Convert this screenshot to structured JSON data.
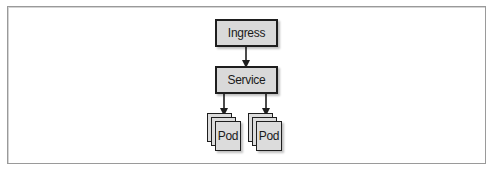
{
  "diagram": {
    "nodes": {
      "ingress": {
        "label": "Ingress"
      },
      "service": {
        "label": "Service"
      },
      "pod_group_left": {
        "label": "Pod"
      },
      "pod_group_right": {
        "label": "Pod"
      }
    },
    "edges": [
      {
        "from": "Ingress",
        "to": "Service"
      },
      {
        "from": "Service",
        "to": "Pod (left group)"
      },
      {
        "from": "Service",
        "to": "Pod (right group)"
      }
    ],
    "colors": {
      "node_fill": "#d9d9d9",
      "node_border": "#1e1e1e",
      "frame_border": "#9a9a9a"
    }
  }
}
